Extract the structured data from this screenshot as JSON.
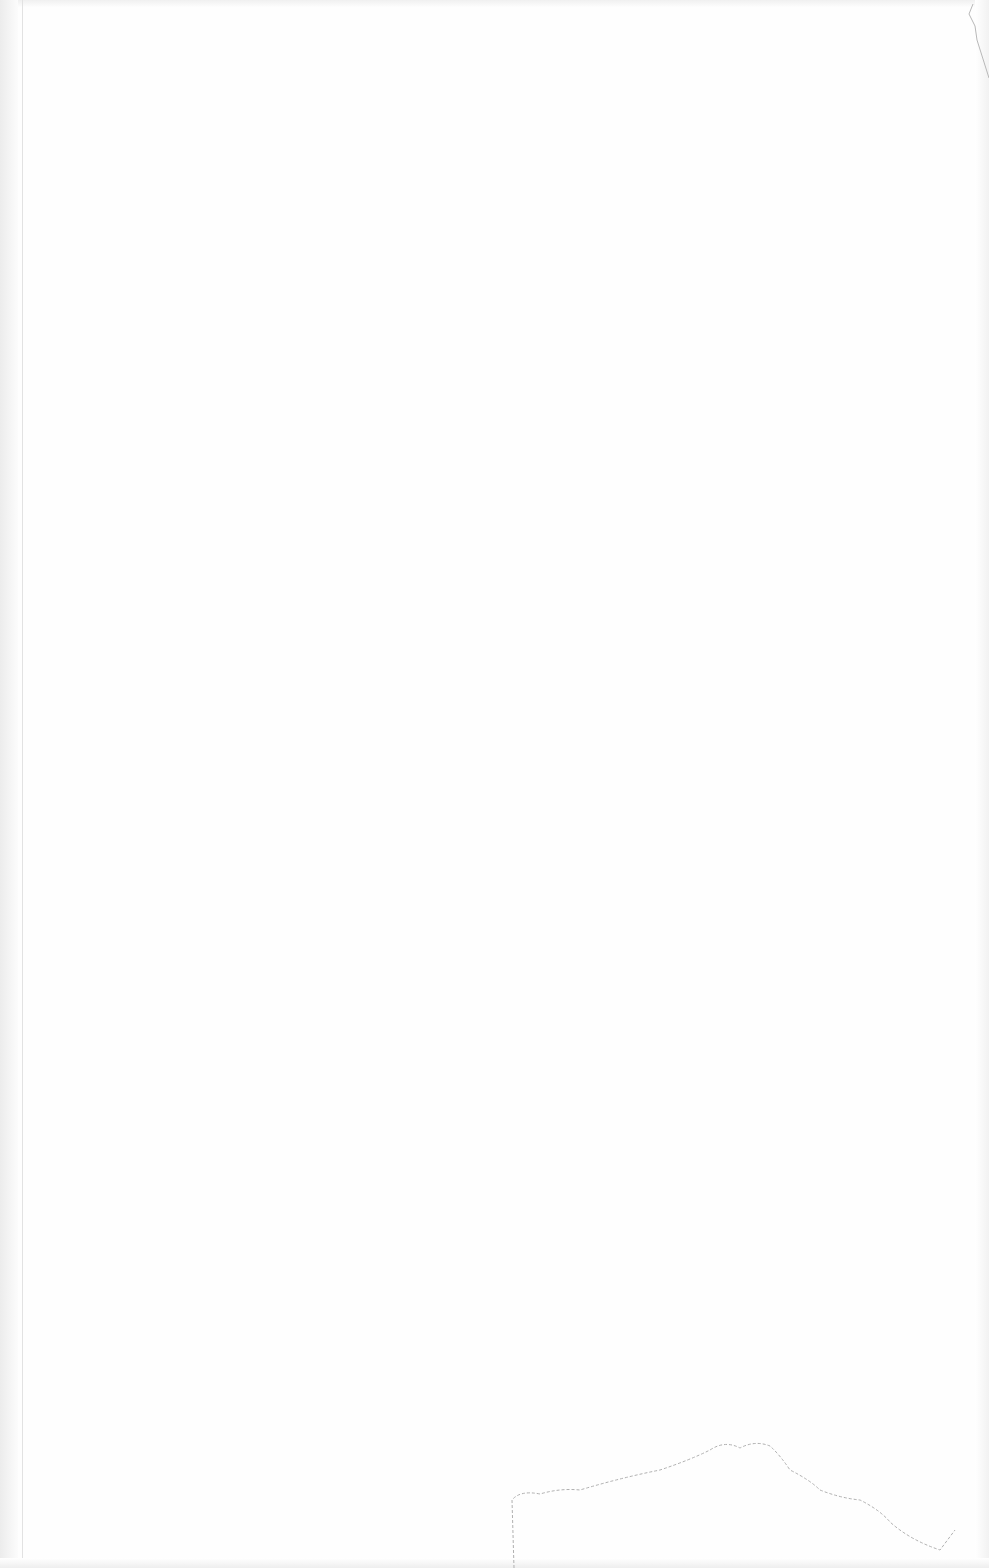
{
  "document": {
    "type": "scanned blank page",
    "text_content": [],
    "marks": [
      "left-binding-gutter",
      "folded-top-right-corner",
      "torn-bottom-edge"
    ]
  },
  "colors": {
    "paper": "#fefefe",
    "edge_shadow": "#ececec",
    "mark": "#b0b0b0"
  }
}
